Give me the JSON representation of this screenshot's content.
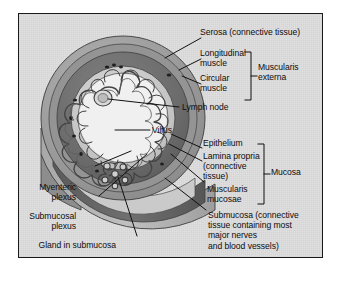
{
  "figure": {
    "panel": {
      "background_color": "#dedede",
      "border_color": "#1a1a1a"
    },
    "palette": {
      "serosa": "#9a9a9a",
      "longitudinal_muscle": "#8f8f8f",
      "circular_muscle": "#6d6d6d",
      "submucosa": "#c9c9c9",
      "mucosa_lumen": "#efefef",
      "villi_outline": "#4a4a4a",
      "cut_face_light": "#b4b4b4",
      "cut_face_dark": "#5f5f5f",
      "leader_line": "#111111"
    },
    "labels": [
      {
        "id": "serosa",
        "text": "Serosa (connective tissue)",
        "align": "left"
      },
      {
        "id": "longitudinal-muscle",
        "text": "Longitudinal\nmuscle",
        "align": "left"
      },
      {
        "id": "circular-muscle",
        "text": "Circular\nmuscle",
        "align": "left"
      },
      {
        "id": "muscularis-externa",
        "text": "Muscularis\nexterna",
        "align": "left"
      },
      {
        "id": "lymph-node",
        "text": "Lymph node",
        "align": "left"
      },
      {
        "id": "villus",
        "text": "Villus",
        "align": "left"
      },
      {
        "id": "epithelium",
        "text": "Epithelium",
        "align": "left"
      },
      {
        "id": "lamina-propria",
        "text": "Lamina propria\n(connective\ntissue)",
        "align": "left"
      },
      {
        "id": "muscularis-mucosae",
        "text": "Muscularis\nmucosae",
        "align": "left"
      },
      {
        "id": "mucosa",
        "text": "Mucosa",
        "align": "left"
      },
      {
        "id": "submucosa",
        "text": "Submucosa (connective\ntissue containing most\nmajor nerves\nand blood vessels)",
        "align": "left"
      },
      {
        "id": "myenteric-plexus",
        "text": "Myenteric\nplexus",
        "align": "right"
      },
      {
        "id": "submucosal-plexus",
        "text": "Submucosal\nplexus",
        "align": "right"
      },
      {
        "id": "gland-in-submucosa",
        "text": "Gland in submucosa",
        "align": "right"
      }
    ],
    "brackets": [
      {
        "id": "muscularis-externa-bracket",
        "groups": [
          "Longitudinal muscle",
          "Circular muscle"
        ],
        "label": "Muscularis externa"
      },
      {
        "id": "mucosa-bracket",
        "groups": [
          "Epithelium",
          "Lamina propria (connective tissue)",
          "Muscularis mucosae"
        ],
        "label": "Mucosa"
      }
    ]
  }
}
